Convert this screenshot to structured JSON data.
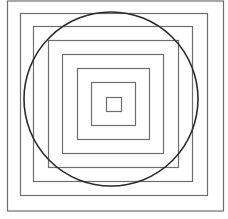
{
  "diagram": {
    "square_stroke_color": "#6e6e6e",
    "circle_stroke_color": "#2b2b2b",
    "squares": [
      {
        "x": 7,
        "y": 0.5,
        "w": 216,
        "h": 210
      },
      {
        "x": 20,
        "y": 13,
        "w": 187,
        "h": 182
      },
      {
        "x": 33,
        "y": 26,
        "w": 159,
        "h": 155
      },
      {
        "x": 48,
        "y": 40,
        "w": 130,
        "h": 127
      },
      {
        "x": 62,
        "y": 54,
        "w": 101,
        "h": 99
      },
      {
        "x": 77,
        "y": 68,
        "w": 72,
        "h": 71
      },
      {
        "x": 91,
        "y": 82,
        "w": 44,
        "h": 43
      },
      {
        "x": 106,
        "y": 97,
        "w": 15,
        "h": 14
      }
    ],
    "circle": {
      "cx": 111,
      "cy": 99,
      "r": 87
    }
  }
}
